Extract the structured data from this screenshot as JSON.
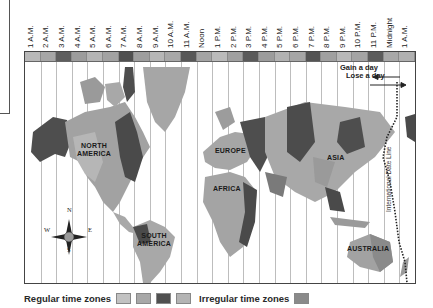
{
  "map": {
    "title": "World time zones",
    "hour_labels": [
      "1 A.M.",
      "2 A.M.",
      "3 A.M.",
      "4 A.M.",
      "5 A.M.",
      "6 A.M.",
      "7 A.M.",
      "8 A.M.",
      "9 A.M.",
      "10 A.M.",
      "11 A.M.",
      "Noon",
      "1 P.M.",
      "2 P.M.",
      "3 P.M.",
      "4 P.M.",
      "5 P.M.",
      "6 P.M.",
      "7 P.M.",
      "8 P.M.",
      "9 P.M.",
      "10 P.M.",
      "11 P.M.",
      "Midnight",
      "1 A.M."
    ],
    "band_colors": [
      "#b8b8b8",
      "#a6a6a6",
      "#5e5e5e",
      "#9c9c9c",
      "#b4b4b4",
      "#a2a2a2",
      "#505050",
      "#9e9e9e",
      "#b6b6b6",
      "#a8a8a8",
      "#585858",
      "#a4a4a4",
      "#bababa",
      "#a0a0a0",
      "#5a5a5a",
      "#9c9c9c",
      "#b2b2b2",
      "#a6a6a6",
      "#545454",
      "#a0a0a0",
      "#b8b8b8",
      "#a4a4a4",
      "#5c5c5c",
      "#a8a8a8",
      "#b0b0b0"
    ],
    "regions": {
      "north_america": "NORTH\nAMERICA",
      "south_america": "SOUTH\nAMERICA",
      "europe": "EUROPE",
      "africa": "AFRICA",
      "asia": "ASIA",
      "australia": "AUSTRALIA"
    },
    "annotations": {
      "gain": "Gain a day",
      "lose": "Lose a day",
      "date_line": "International Date Line"
    },
    "compass": {
      "n": "N",
      "s": "S",
      "e": "E",
      "w": "W"
    }
  },
  "legend": {
    "regular_label": "Regular time zones",
    "regular_colors": [
      "#c2c2c2",
      "#a8a8a8",
      "#505050",
      "#b4b4b4"
    ],
    "irregular_label": "Irregular time zones",
    "irregular_color": "#8a8a8a"
  }
}
